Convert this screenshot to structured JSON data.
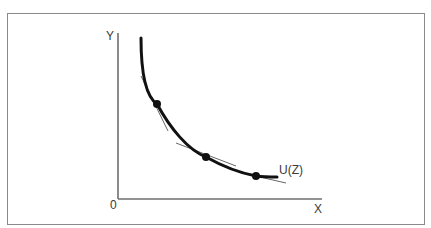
{
  "diagram": {
    "type": "indifference-curve",
    "axes": {
      "x_label": "X",
      "y_label": "Y",
      "origin_label": "0"
    },
    "curve": {
      "label": "U(Z)",
      "shape": "convex decreasing"
    },
    "points": [
      {
        "id": "p1",
        "x": 157,
        "y": 104,
        "tangent": true
      },
      {
        "id": "p2",
        "x": 206,
        "y": 157,
        "tangent": true
      },
      {
        "id": "p3",
        "x": 256,
        "y": 176,
        "tangent": true
      }
    ],
    "colors": {
      "curve": "#111111",
      "axes": "#6e6e6e",
      "tangent": "#555555",
      "frame": "#8a8a8a",
      "text": "#3a3a3a"
    }
  }
}
